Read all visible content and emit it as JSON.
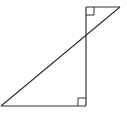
{
  "diagram": {
    "type": "geometry",
    "stroke_color": "#333333",
    "background": "#ffffff",
    "points": {
      "bottom_left": [
        1,
        106
      ],
      "bottom_right": [
        86,
        106
      ],
      "top_left": [
        86,
        7
      ],
      "top_right": [
        120,
        7
      ]
    },
    "segments": [
      {
        "name": "bottom-edge",
        "from": [
          1,
          106
        ],
        "to": [
          86,
          106
        ]
      },
      {
        "name": "vertical-edge",
        "from": [
          86,
          7
        ],
        "to": [
          86,
          106
        ]
      },
      {
        "name": "top-edge",
        "from": [
          86,
          7
        ],
        "to": [
          120,
          7
        ]
      },
      {
        "name": "diagonal",
        "from": [
          1,
          106
        ],
        "to": [
          120,
          7
        ]
      }
    ],
    "right_angle_markers": [
      {
        "name": "top-right-angle",
        "corner": [
          86,
          7
        ],
        "size": 8
      },
      {
        "name": "bottom-right-angle",
        "corner": [
          86,
          106
        ],
        "size": 8
      }
    ]
  }
}
